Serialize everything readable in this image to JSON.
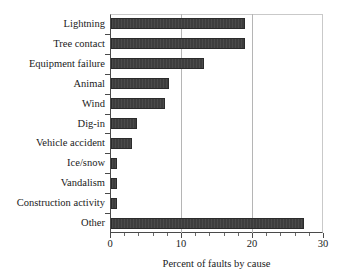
{
  "chart_data": {
    "type": "bar",
    "orientation": "horizontal",
    "title": "",
    "xlabel": "Percent of faults by cause",
    "ylabel": "",
    "categories": [
      "Lightning",
      "Tree contact",
      "Equipment failure",
      "Animal",
      "Wind",
      "Dig-in",
      "Vehicle accident",
      "Ice/snow",
      "Vandalism",
      "Construction activity",
      "Other"
    ],
    "values": [
      18.9,
      18.9,
      13.1,
      8.2,
      7.6,
      3.6,
      2.9,
      0.8,
      0.8,
      0.8,
      27.2
    ],
    "xlim": [
      0,
      30
    ],
    "xticks": [
      0,
      10,
      20,
      30
    ],
    "xticklabels": [
      "0",
      "10",
      "20",
      "30"
    ],
    "minor_tick_step": 2,
    "grid": "vertical gridlines at 10 and 20",
    "gridlines": [
      10,
      20
    ],
    "legend": "none",
    "bar_color": "#3d3d3d",
    "gridline_color": "#b5b5b5",
    "axis_color": "#4a4a4a",
    "background_color": "#ffffff"
  }
}
